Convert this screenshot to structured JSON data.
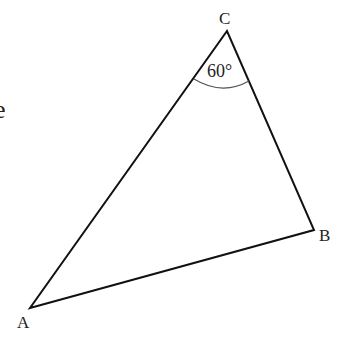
{
  "diagram": {
    "type": "triangle",
    "vertices": {
      "A": {
        "label": "A",
        "x": 30,
        "y": 308
      },
      "B": {
        "label": "B",
        "x": 314,
        "y": 230
      },
      "C": {
        "label": "C",
        "x": 227,
        "y": 31
      }
    },
    "angle_C": {
      "label": "60°",
      "value_deg": 60
    },
    "partial_text": "e",
    "colors": {
      "stroke": "#111111",
      "arc": "#444444",
      "text": "#222222"
    }
  }
}
